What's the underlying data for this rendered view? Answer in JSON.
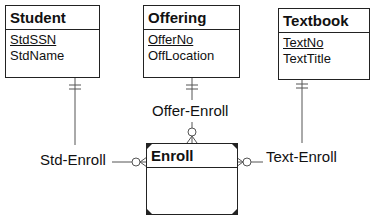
{
  "diagram": {
    "type": "ERD (crow's foot notation)",
    "entities": [
      {
        "name": "Student",
        "attributes": [
          {
            "name": "StdSSN",
            "primary_key": true
          },
          {
            "name": "StdName",
            "primary_key": false
          }
        ]
      },
      {
        "name": "Offering",
        "attributes": [
          {
            "name": "OfferNo",
            "primary_key": true
          },
          {
            "name": "OffLocation",
            "primary_key": false
          }
        ]
      },
      {
        "name": "Textbook",
        "attributes": [
          {
            "name": "TextNo",
            "primary_key": true
          },
          {
            "name": "TextTitle",
            "primary_key": false
          }
        ]
      },
      {
        "name": "Enroll",
        "attributes": [],
        "weak_entity": true
      }
    ],
    "relationships": [
      {
        "name": "Std-Enroll",
        "from": "Student",
        "to": "Enroll",
        "from_cardinality": "one-and-only-one",
        "to_cardinality": "zero-or-many",
        "identifying": true
      },
      {
        "name": "Offer-Enroll",
        "from": "Offering",
        "to": "Enroll",
        "from_cardinality": "one-and-only-one",
        "to_cardinality": "zero-or-many",
        "identifying": true
      },
      {
        "name": "Text-Enroll",
        "from": "Textbook",
        "to": "Enroll",
        "from_cardinality": "one-and-only-one",
        "to_cardinality": "zero-or-many",
        "identifying": true
      }
    ],
    "line_color": "#222222"
  }
}
